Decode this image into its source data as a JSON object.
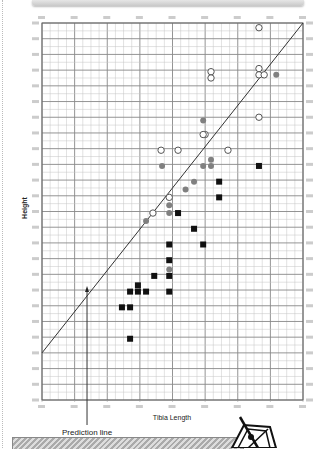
{
  "chart_data": {
    "type": "scatter",
    "title": "",
    "xlabel": "Tibia Length",
    "ylabel": "Height",
    "xlim": [
      0,
      8
    ],
    "ylim": [
      0,
      24
    ],
    "x_major_ticks": 8,
    "x_minor_per_major": 4,
    "y_major_ticks": 24,
    "y_minor_per_major": 2,
    "grid": true,
    "tick_labels_note": "tick labels illegible in source; values in grid units",
    "series": [
      {
        "name": "open-circles",
        "marker": "open-circle",
        "points": [
          [
            6.65,
            23.7
          ],
          [
            5.18,
            20.9
          ],
          [
            5.18,
            20.5
          ],
          [
            6.65,
            21.1
          ],
          [
            6.65,
            20.7
          ],
          [
            6.81,
            20.7
          ],
          [
            6.65,
            18.0
          ],
          [
            3.65,
            15.9
          ],
          [
            4.17,
            15.9
          ],
          [
            5.7,
            15.9
          ],
          [
            5.0,
            16.9
          ],
          [
            4.94,
            16.9
          ],
          [
            3.9,
            12.9
          ],
          [
            3.4,
            11.9
          ]
        ]
      },
      {
        "name": "gray-circles",
        "marker": "filled-gray-circle",
        "points": [
          [
            7.18,
            20.7
          ],
          [
            4.94,
            17.8
          ],
          [
            3.68,
            14.9
          ],
          [
            5.18,
            15.3
          ],
          [
            5.18,
            14.9
          ],
          [
            4.94,
            14.9
          ],
          [
            4.66,
            13.9
          ],
          [
            4.4,
            13.4
          ],
          [
            3.9,
            12.4
          ],
          [
            3.9,
            11.9
          ],
          [
            3.19,
            11.4
          ],
          [
            3.9,
            8.3
          ]
        ]
      },
      {
        "name": "black-squares",
        "marker": "filled-square",
        "points": [
          [
            6.65,
            14.9
          ],
          [
            5.43,
            13.9
          ],
          [
            5.43,
            12.9
          ],
          [
            4.17,
            11.9
          ],
          [
            4.66,
            10.9
          ],
          [
            4.94,
            9.9
          ],
          [
            3.9,
            9.9
          ],
          [
            3.9,
            8.9
          ],
          [
            3.9,
            7.9
          ],
          [
            3.9,
            6.9
          ],
          [
            3.44,
            7.9
          ],
          [
            2.94,
            6.9
          ],
          [
            3.19,
            6.9
          ],
          [
            2.7,
            6.9
          ],
          [
            2.94,
            7.3
          ],
          [
            2.45,
            5.9
          ],
          [
            2.7,
            5.9
          ],
          [
            2.7,
            3.9
          ]
        ]
      }
    ],
    "prediction_line": {
      "x": [
        0,
        8
      ],
      "y": [
        3.0,
        24
      ]
    },
    "annotation": {
      "text": "Prediction line",
      "x": 1.38,
      "y": 7.0
    }
  },
  "colors": {
    "grid_major": "#888888",
    "grid_minor": "#c4c4c4",
    "gray_marker": "#808080",
    "black_marker": "#111111"
  }
}
